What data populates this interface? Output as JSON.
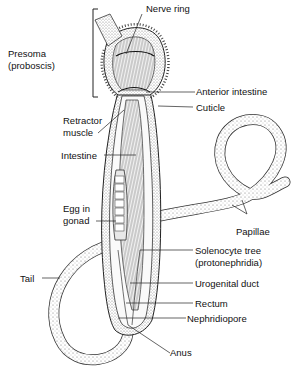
{
  "diagram": {
    "background": "#ffffff",
    "ink_color": "#1a1a1a",
    "stipple_color": "#8a8a8a"
  },
  "labels": {
    "nerve_ring": "Nerve ring",
    "presoma_line1": "Presoma",
    "presoma_line2": "(proboscis)",
    "anterior_intestine": "Anterior intestine",
    "cuticle": "Cuticle",
    "retractor_line1": "Retractor",
    "retractor_line2": "muscle",
    "intestine": "Intestine",
    "egg_line1": "Egg in",
    "egg_line2": "gonad",
    "papillae": "Papillae",
    "solenocyte_line1": "Solenocyte tree",
    "solenocyte_line2": "(protonephridia)",
    "tail": "Tail",
    "urogenital_duct": "Urogenital duct",
    "rectum": "Rectum",
    "nephridiopore": "Nephridiopore",
    "anus": "Anus"
  }
}
